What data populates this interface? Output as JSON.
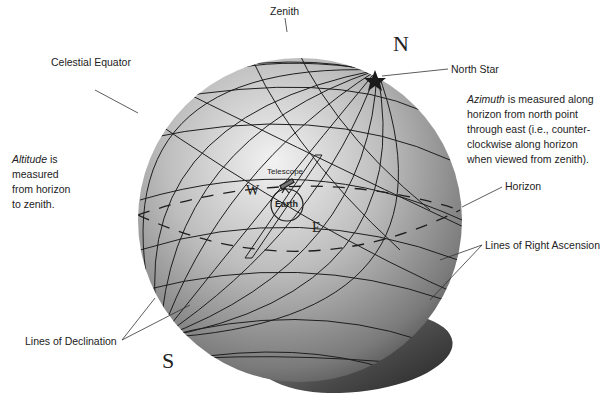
{
  "labels": {
    "zenith": "Zenith",
    "celestial_equator": "Celestial Equator",
    "north_star": "North Star",
    "horizon": "Horizon",
    "lines_of_right_ascension": "Lines of Right Ascension",
    "lines_of_declination": "Lines of Declination",
    "telescope": "Telescope",
    "earth": "Earth"
  },
  "poles": {
    "north": "N",
    "south": "S"
  },
  "directions": {
    "west": "W",
    "east": "E"
  },
  "notes": {
    "altitude": {
      "term": "Altitude",
      "rest_line1": " is",
      "line2": "measured",
      "line3": "from horizon",
      "line4": "to zenith."
    },
    "azimuth": {
      "term": "Azimuth",
      "rest_line1": " is measured along",
      "line2": "horizon from north point",
      "line3": "through east (i.e., counter-",
      "line4": "clockwise along horizon",
      "line5": "when viewed from zenith)."
    }
  },
  "colors": {
    "sphere_light": "#e8e8e8",
    "sphere_dark": "#4a4a4a",
    "grid_line": "#1e1e1e",
    "horizon_disk": "#6a6a6a",
    "star": "#1a1a1a"
  }
}
